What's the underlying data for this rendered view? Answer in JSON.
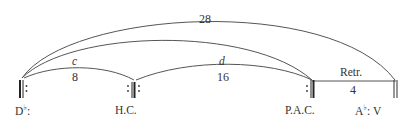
{
  "diagram": {
    "type": "formal-section-arc-diagram",
    "nodes": [
      {
        "id": "dflat",
        "label": "D",
        "accidental": "♭",
        "suffix": ":",
        "barline": "double-thick-repeat-right"
      },
      {
        "id": "hc",
        "label": "H.C.",
        "barline": "double-thick-repeat-both"
      },
      {
        "id": "pac",
        "label": "P.A.C.",
        "barline": "double-thick-repeat-left"
      },
      {
        "id": "aflat",
        "label_root": "A",
        "label_accidental": "♭",
        "label_rest": ": V",
        "barline": "double-thin"
      }
    ],
    "arcs": [
      {
        "id": "arc-28",
        "from": "dflat",
        "to": "aflat",
        "above": "28"
      },
      {
        "id": "arc-cd-span",
        "from": "dflat",
        "to": "pac",
        "above": ""
      },
      {
        "id": "arc-8",
        "from": "dflat",
        "to": "hc",
        "above": "c",
        "below": "8"
      },
      {
        "id": "arc-16",
        "from": "hc",
        "to": "pac",
        "above": "d",
        "below": "16"
      }
    ],
    "segment": {
      "id": "retransition",
      "from": "pac",
      "to": "aflat",
      "above": "Retr.",
      "below": "4"
    }
  },
  "labels": {
    "arc_28": "28",
    "arc_c": "c",
    "arc_8": "8",
    "arc_d": "d",
    "arc_16": "16",
    "retr": "Retr.",
    "retr_len": "4",
    "dflat_root": "D",
    "dflat_acc": "♭",
    "dflat_colon": ":",
    "hc": "H.C.",
    "pac": "P.A.C.",
    "aflat_root": "A",
    "aflat_acc": "♭",
    "aflat_rest": ": V"
  },
  "colors": {
    "line": "#555555",
    "text": "#333333",
    "background": "#ffffff"
  }
}
